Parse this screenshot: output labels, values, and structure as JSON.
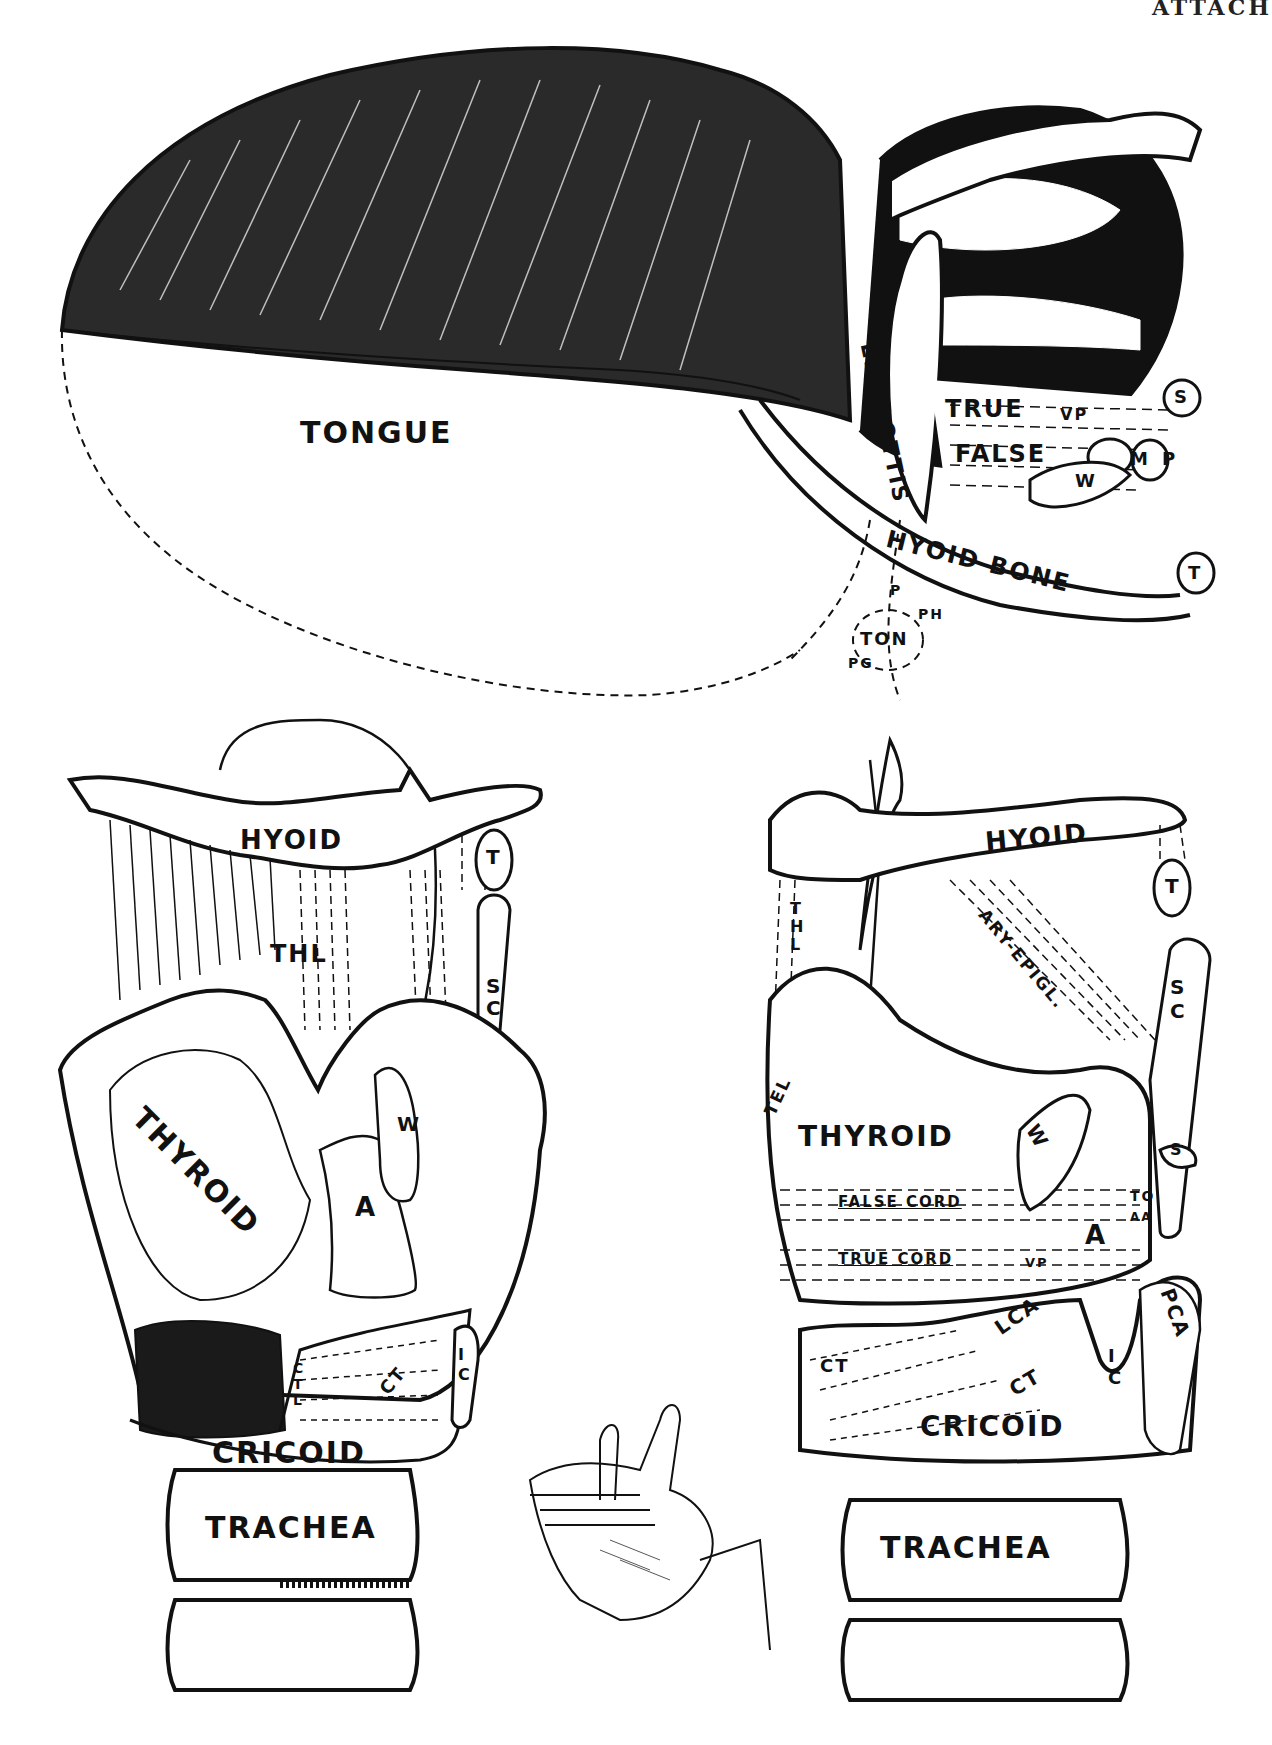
{
  "page_header": {
    "corner_text": "ATTACH"
  },
  "figures": {
    "lateral_view": {
      "labels": {
        "tongue": "TONGUE",
        "epiglottis": "EPIGLOTTIS",
        "true": "TRUE",
        "false": "FALSE",
        "vp": "VP",
        "s": "S",
        "m": "M",
        "p": "P",
        "w": "W",
        "hyoid_bone": "HYOID BONE",
        "t": "T",
        "p2": "P",
        "ph": "PH",
        "ton": "TON",
        "pg": "PG"
      }
    },
    "front_view": {
      "labels": {
        "hyoid": "HYOID",
        "thl": "THL",
        "t": "T",
        "sc": "SC",
        "thyroid": "THYROID",
        "w": "W",
        "a": "A",
        "ctl": "CTL",
        "ct": "CT",
        "ic": "IC",
        "cricoid": "CRICOID",
        "trachea": "TRACHEA"
      }
    },
    "side_view": {
      "labels": {
        "hyoid": "HYOID",
        "thl": "THL",
        "ary_epigl": "ARY-EPIGL.",
        "t": "T",
        "sc": "SC",
        "tel": "TEL",
        "thyroid": "THYROID",
        "w": "W",
        "s": "S",
        "false_cord": "FALSE CORD",
        "true_cord": "TRUE CORD",
        "to": "TO",
        "aa": "AA",
        "a": "A",
        "vp": "VP",
        "lca": "LCA",
        "pca": "PCA",
        "ct_left": "CT",
        "ct_center": "CT",
        "ic": "IC",
        "cricoid": "CRICOID",
        "trachea": "TRACHEA"
      }
    },
    "hand_sketch": {
      "description": "hand-icon"
    }
  }
}
